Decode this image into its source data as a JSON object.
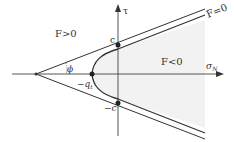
{
  "diagram": {
    "type": "yield-surface",
    "colors": {
      "line": "#333333",
      "axis": "#555555",
      "shade": "#f2f2f2",
      "background": "#ffffff"
    },
    "axes": {
      "horizontal_label": "σ",
      "horizontal_subscript": "N",
      "vertical_label": "τ"
    },
    "regions": {
      "outside": "F>0",
      "inside": "F<0",
      "boundary": "F=0"
    },
    "points": {
      "cohesion_top": "c",
      "cohesion_bottom": "−c",
      "tension_cutoff": "−q",
      "tension_cutoff_subscript": "t"
    },
    "angle_label": "ϕ"
  }
}
